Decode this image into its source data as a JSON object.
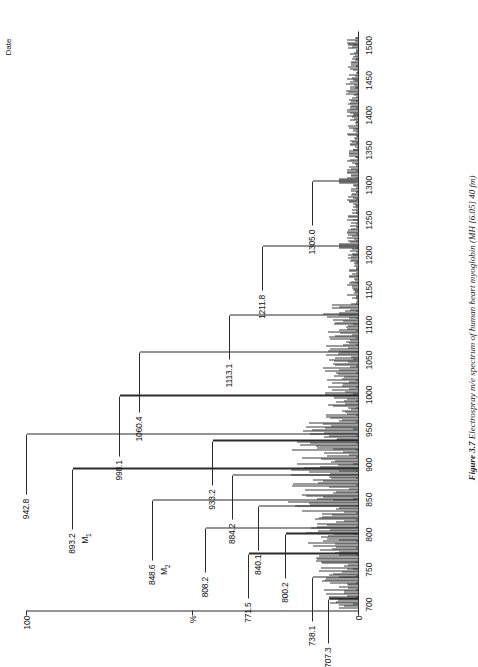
{
  "figure": {
    "caption_label": "Figure 3.7",
    "caption_text": "Electrospray m/e spectrum of human heart myoglobin (MH [6.05] 40 fm)",
    "date_label": "Date"
  },
  "axes": {
    "x": {
      "title": "",
      "min": 690,
      "max": 1520,
      "major_ticks": [
        700,
        750,
        800,
        850,
        900,
        950,
        1000,
        1050,
        1100,
        1150,
        1200,
        1250,
        1300,
        1350,
        1400,
        1450,
        1500
      ],
      "tick_labels": [
        "700",
        "750",
        "800",
        "850",
        "900",
        "950",
        "1000",
        "1050",
        "1100",
        "1150",
        "1200",
        "1250",
        "1300",
        "1350",
        "1400",
        "1450",
        "1500"
      ],
      "minor_tick_step": 10
    },
    "y": {
      "title": "%",
      "min": 0,
      "max": 100,
      "labels": [
        "100",
        "%",
        "0"
      ],
      "top_label": "100",
      "mid_label": "%",
      "zero_label": "0"
    }
  },
  "chart_data": {
    "type": "line",
    "title": "Electrospray m/e spectrum of human heart myoglobin",
    "xlabel": "m/e",
    "ylabel": "%",
    "xlim": [
      690,
      1520
    ],
    "ylim": [
      0,
      100
    ],
    "grid": false,
    "legend": "none",
    "x": [
      707.3,
      738.1,
      771.5,
      800.2,
      808.2,
      840.1,
      848.6,
      884.2,
      893.2,
      933.2,
      942.8,
      998.1,
      1060.4,
      1113.1,
      1211.8,
      1305.0
    ],
    "y": [
      9,
      14,
      33,
      22,
      46,
      30,
      62,
      38,
      86,
      44,
      100,
      72,
      66,
      39,
      29,
      14
    ],
    "labeled_peaks": [
      {
        "mz": "707.3",
        "value": 707.3,
        "intensity": 9,
        "annotation": ""
      },
      {
        "mz": "738.1",
        "value": 738.1,
        "intensity": 14,
        "annotation": ""
      },
      {
        "mz": "771.5",
        "value": 771.5,
        "intensity": 33,
        "annotation": ""
      },
      {
        "mz": "800.2",
        "value": 800.2,
        "intensity": 22,
        "annotation": ""
      },
      {
        "mz": "808.2",
        "value": 808.2,
        "intensity": 46,
        "annotation": ""
      },
      {
        "mz": "840.1",
        "value": 840.1,
        "intensity": 30,
        "annotation": ""
      },
      {
        "mz": "848.6",
        "value": 848.6,
        "intensity": 62,
        "annotation": "M2"
      },
      {
        "mz": "884.2",
        "value": 884.2,
        "intensity": 38,
        "annotation": ""
      },
      {
        "mz": "893.2",
        "value": 893.2,
        "intensity": 86,
        "annotation": "M1"
      },
      {
        "mz": "933.2",
        "value": 933.2,
        "intensity": 44,
        "annotation": ""
      },
      {
        "mz": "942.8",
        "value": 942.8,
        "intensity": 100,
        "annotation": ""
      },
      {
        "mz": "998.1",
        "value": 998.1,
        "intensity": 72,
        "annotation": ""
      },
      {
        "mz": "1060.4",
        "value": 1060.4,
        "intensity": 66,
        "annotation": ""
      },
      {
        "mz": "1113.1",
        "value": 1113.1,
        "intensity": 39,
        "annotation": ""
      },
      {
        "mz": "1211.8",
        "value": 1211.8,
        "intensity": 29,
        "annotation": ""
      },
      {
        "mz": "1305.0",
        "value": 1305.0,
        "intensity": 14,
        "annotation": ""
      }
    ],
    "annotations": [
      {
        "text": "M1",
        "near_peak": "893.2"
      },
      {
        "text": "M2",
        "near_peak": "848.6"
      }
    ]
  }
}
